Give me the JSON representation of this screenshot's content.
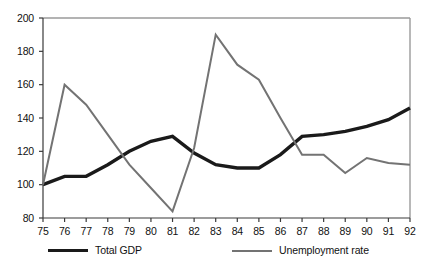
{
  "chart_data": {
    "type": "line",
    "title": "",
    "subtitle": "",
    "xlabel": "",
    "ylabel": "",
    "x": [
      "75",
      "76",
      "77",
      "78",
      "79",
      "80",
      "81",
      "82",
      "83",
      "84",
      "85",
      "86",
      "87",
      "88",
      "89",
      "90",
      "91",
      "92"
    ],
    "xlim": [
      75,
      92
    ],
    "ylim": [
      80,
      200
    ],
    "yticks": [
      80,
      100,
      120,
      140,
      160,
      180,
      200
    ],
    "xticks": [
      "75",
      "76",
      "77",
      "78",
      "79",
      "80",
      "81",
      "82",
      "83",
      "84",
      "85",
      "86",
      "87",
      "88",
      "89",
      "90",
      "91",
      "92"
    ],
    "grid": false,
    "legend_position": "bottom",
    "series": [
      {
        "name": "Total GDP",
        "color": "#1a1a1a",
        "line_width": 3.4,
        "values": [
          100,
          105,
          105,
          112,
          120,
          126,
          129,
          119,
          112,
          110,
          110,
          118,
          129,
          130,
          132,
          135,
          139,
          146
        ]
      },
      {
        "name": "Unemployment rate",
        "color": "#737373",
        "line_width": 2.0,
        "values": [
          100,
          160,
          148,
          130,
          112,
          98,
          84,
          122,
          190,
          172,
          163,
          140,
          118,
          118,
          107,
          116,
          113,
          112
        ]
      }
    ]
  },
  "axes": {
    "y_tick_labels": [
      "200",
      "180",
      "160",
      "140",
      "120",
      "100",
      "80"
    ],
    "x_tick_labels": [
      "75",
      "76",
      "77",
      "78",
      "79",
      "80",
      "81",
      "82",
      "83",
      "84",
      "85",
      "86",
      "87",
      "88",
      "89",
      "90",
      "91",
      "92"
    ]
  },
  "legend": {
    "items": [
      {
        "label": "Total GDP"
      },
      {
        "label": "Unemployment rate"
      }
    ]
  },
  "colors": {
    "gdp_line": "#1a1a1a",
    "unemployment_line": "#737373",
    "axis": "#3a3a3a",
    "frame": "#9a9a9a",
    "background": "#ffffff"
  }
}
